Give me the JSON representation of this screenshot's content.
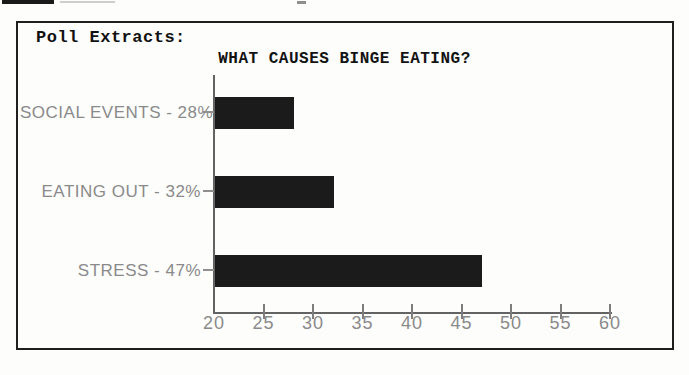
{
  "panel": {
    "heading": "Poll Extracts:"
  },
  "chart_data": {
    "type": "bar",
    "orientation": "horizontal",
    "title": "WHAT CAUSES BINGE EATING?",
    "categories": [
      "SOCIAL EVENTS",
      "EATING OUT",
      "STRESS"
    ],
    "values": [
      28,
      32,
      47
    ],
    "value_suffix": "%",
    "bar_labels": [
      "SOCIAL EVENTS - 28%",
      "EATING OUT - 32%",
      "STRESS - 47%"
    ],
    "xlabel": "",
    "ylabel": "",
    "xlim": [
      20,
      60
    ],
    "x_ticks": [
      20,
      25,
      30,
      35,
      40,
      45,
      50,
      55,
      60
    ],
    "grid": false,
    "legend": false,
    "colors": {
      "bar": "#1b1b1b",
      "axis": "#636363",
      "tick": "#7d7d7d",
      "label": "#8a8a8a",
      "title": "#131313"
    }
  }
}
